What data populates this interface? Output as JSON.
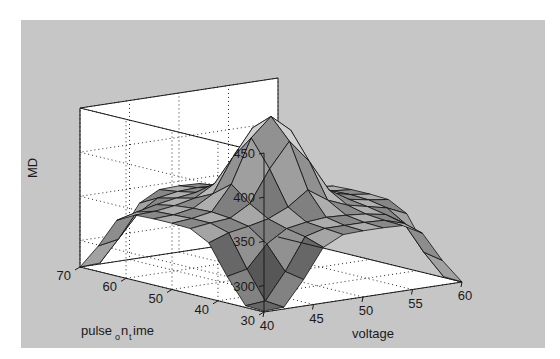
{
  "figure": {
    "background_color": "#c6c6c6",
    "page_color": "#ffffff",
    "wall_color": "#ffffff",
    "axis_color": "#1a1a1a",
    "grid_color": "#2a2a2a"
  },
  "chart_data": {
    "type": "heatmap",
    "render": "surface3d",
    "title": "",
    "subtitle": "",
    "xlabel": "voltage",
    "ylabel": "pulse_on_time",
    "zlabel": "MD",
    "ylabel_display": {
      "base1": "pulse",
      "sub1": "o",
      "base2": "n",
      "sub2": "t",
      "base3": "ime"
    },
    "grid": true,
    "legend": "none",
    "xlim": [
      40,
      60
    ],
    "ylim": [
      30,
      70
    ],
    "zlim": [
      270,
      450
    ],
    "xticks": [
      40,
      45,
      50,
      55,
      60
    ],
    "yticks": [
      30,
      40,
      50,
      60,
      70
    ],
    "zticks": [
      300,
      350,
      400,
      450
    ],
    "xticklabels": [
      "40",
      "45",
      "50",
      "55",
      "60"
    ],
    "yticklabels": [
      "30",
      "40",
      "50",
      "60",
      "70"
    ],
    "zticklabels": [
      "300",
      "350",
      "400",
      "450"
    ],
    "x": [
      40,
      42,
      44,
      46,
      48,
      50,
      52,
      54,
      56,
      58,
      60
    ],
    "y": [
      30,
      34,
      38,
      42,
      46,
      50,
      54,
      58,
      62,
      66,
      70
    ],
    "z": [
      [
        271,
        272,
        300,
        333,
        344,
        345,
        345,
        344,
        332,
        298,
        270
      ],
      [
        272,
        274,
        304,
        340,
        346,
        346,
        346,
        345,
        338,
        302,
        271
      ],
      [
        300,
        305,
        330,
        344,
        348,
        350,
        349,
        347,
        343,
        329,
        299
      ],
      [
        333,
        341,
        345,
        350,
        360,
        376,
        361,
        352,
        347,
        342,
        332
      ],
      [
        344,
        347,
        349,
        362,
        398,
        426,
        400,
        364,
        350,
        346,
        343
      ],
      [
        345,
        347,
        351,
        379,
        428,
        449,
        430,
        381,
        352,
        347,
        344
      ],
      [
        345,
        346,
        350,
        363,
        401,
        431,
        403,
        366,
        351,
        346,
        344
      ],
      [
        344,
        345,
        348,
        353,
        366,
        383,
        368,
        355,
        349,
        345,
        343
      ],
      [
        333,
        339,
        344,
        348,
        351,
        353,
        352,
        349,
        345,
        340,
        332
      ],
      [
        299,
        303,
        329,
        343,
        347,
        348,
        347,
        345,
        330,
        304,
        298
      ],
      [
        270,
        271,
        299,
        332,
        344,
        345,
        344,
        333,
        300,
        272,
        269
      ]
    ],
    "shading": "faceted-grayscale",
    "colormap_low": "#4f4f4f",
    "colormap_high": "#d2d2d2"
  },
  "geometry": {
    "corners": {
      "front_bottom": [
        243,
        292
      ],
      "left_bottom": [
        59,
        247
      ],
      "right_bottom": [
        441,
        262
      ],
      "back_bottom": [
        285,
        215
      ],
      "front_top": [
        243,
        133
      ],
      "left_top": [
        59,
        88
      ],
      "right_top": [
        441,
        103
      ],
      "back_top": [
        285,
        56
      ]
    },
    "z_axis_x": 59,
    "z_top_y": 88,
    "z_bottom_y": 247
  }
}
